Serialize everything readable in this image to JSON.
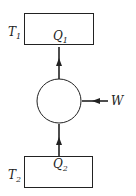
{
  "diagram": {
    "type": "heat-pump-schematic",
    "hot_reservoir": {
      "temp_label": "T",
      "temp_sub": "1",
      "heat_label": "Q",
      "heat_sub": "1"
    },
    "cold_reservoir": {
      "temp_label": "T",
      "temp_sub": "2",
      "heat_label": "Q",
      "heat_sub": "2"
    },
    "work": {
      "label": "W"
    },
    "colors": {
      "stroke": "#222222",
      "background": "#ffffff"
    }
  }
}
